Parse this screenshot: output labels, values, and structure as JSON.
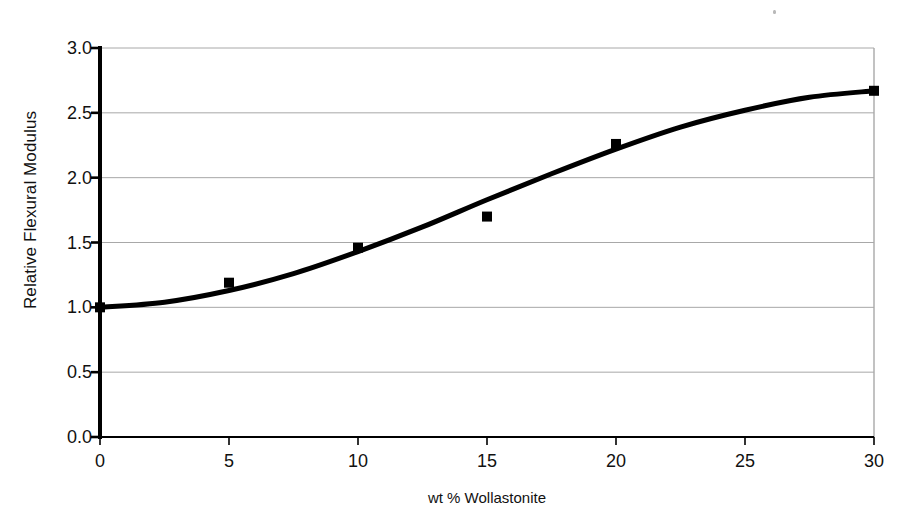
{
  "chart_data": {
    "type": "scatter",
    "title": "",
    "xlabel": "wt % Wollastonite",
    "ylabel": "Relative Flexural Modulus",
    "xlim": [
      0,
      30
    ],
    "ylim": [
      0.0,
      3.0
    ],
    "xticks": [
      "0",
      "5",
      "10",
      "15",
      "20",
      "25",
      "30"
    ],
    "xtick_values": [
      0,
      5,
      10,
      15,
      20,
      25,
      30
    ],
    "yticks": [
      "0.0",
      "0.5",
      "1.0",
      "1.5",
      "2.0",
      "2.5",
      "3.0"
    ],
    "ytick_values": [
      0.0,
      0.5,
      1.0,
      1.5,
      2.0,
      2.5,
      3.0
    ],
    "grid": "horizontal",
    "legend": "none",
    "series": [
      {
        "name": "Measured data",
        "marker": "square",
        "marker_color": "#000000",
        "x": [
          0,
          5,
          10,
          15,
          20,
          30
        ],
        "values": [
          1.0,
          1.19,
          1.46,
          1.7,
          2.26,
          2.67
        ]
      },
      {
        "name": "Fitted sigmoid curve",
        "marker": "none",
        "line_color": "#000000",
        "line_width": 5,
        "x": [
          0,
          2.5,
          5,
          7.5,
          10,
          12.5,
          15,
          17.5,
          20,
          22.5,
          25,
          27.5,
          30
        ],
        "values": [
          1.0,
          1.04,
          1.13,
          1.26,
          1.43,
          1.62,
          1.83,
          2.03,
          2.22,
          2.39,
          2.52,
          2.62,
          2.67
        ]
      }
    ]
  },
  "axis": {
    "x_title": "wt % Wollastonite",
    "y_title": "Relative Flexural Modulus"
  },
  "colors": {
    "axis": "#000000",
    "grid": "#a8a8a8",
    "plot_line": "#000000",
    "marker": "#000000",
    "background": "#ffffff"
  }
}
